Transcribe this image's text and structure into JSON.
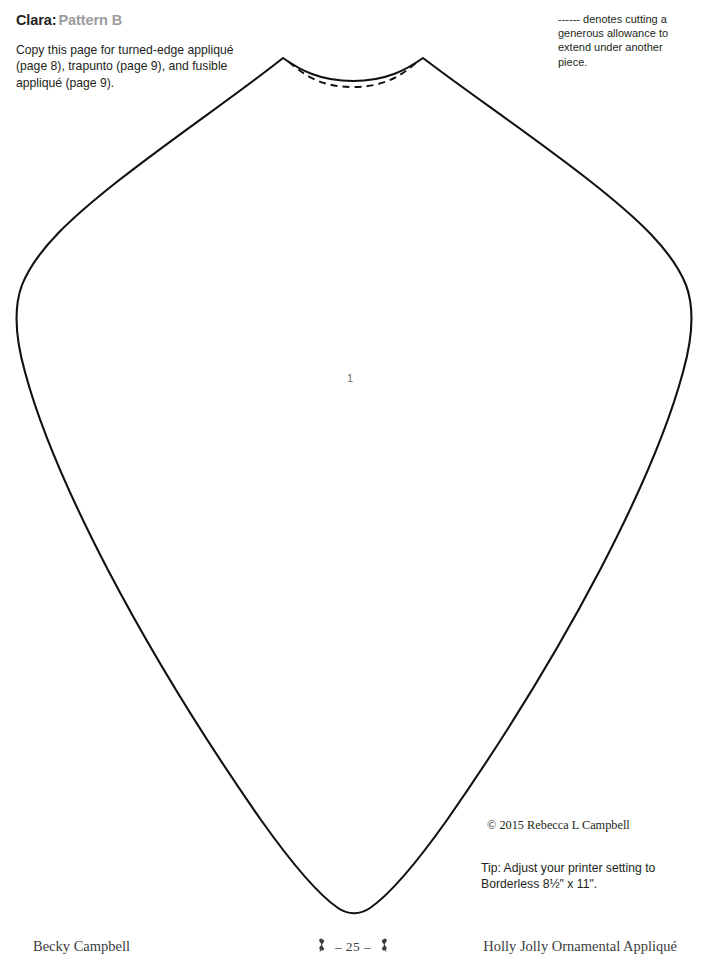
{
  "header": {
    "pattern_name": "Clara:",
    "pattern_variant": "Pattern B",
    "instructions": "Copy this page for turned-edge appliqué (page 8), trapunto (page 9), and fusible appliqué (page 9)."
  },
  "cut_note": {
    "text": "------ denotes cutting a generous allowance to extend under another piece."
  },
  "pattern": {
    "piece_label": "1",
    "outline_color": "#111111",
    "dashed_color": "#111111",
    "shape_name": "clara-ornament-body"
  },
  "notes": {
    "copyright": "© 2015  Rebecca L Campbell",
    "printer_tip": "Tip: Adjust your printer setting to Borderless 8½\" x 11\"."
  },
  "footer": {
    "author": "Becky Campbell",
    "page_number": "– 25 –",
    "book_title": "Holly Jolly Ornamental Appliqué",
    "ornament_left": "bird-ornament-icon",
    "ornament_right": "bird-ornament-icon"
  }
}
